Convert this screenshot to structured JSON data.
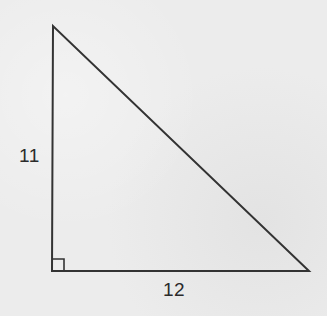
{
  "diagram": {
    "type": "right-triangle",
    "background_color": "#ececec",
    "stroke_color": "#333333",
    "vertices": {
      "top": [
        53,
        26
      ],
      "right_angle": [
        52,
        271
      ],
      "bottom_right": [
        309,
        271
      ]
    },
    "right_angle_marker_size": 12,
    "labels": {
      "vertical_leg": "11",
      "horizontal_leg": "12"
    }
  }
}
